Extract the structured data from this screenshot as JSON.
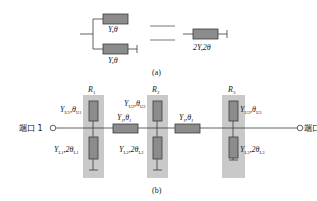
{
  "colors": {
    "component_fill": "#8c8c8c",
    "component_stroke": "#3a3a3a",
    "shade": "#c9c9c9",
    "wire": "#3a3a3a",
    "text": "#222222"
  },
  "part_a": {
    "caption": "(a)",
    "upper_stub_label": "Y,θ",
    "lower_stub_label": "Y,θ",
    "equals": "=",
    "equivalent_label": "2Y,2θ"
  },
  "part_b": {
    "caption": "(b)",
    "port1": "端口 1",
    "port2": "端口 2",
    "resonators": [
      {
        "name": "R",
        "sub": "1",
        "upper": {
          "Y": "Y",
          "Ysub": "U1",
          "t": ",θ",
          "tsub": "U1"
        },
        "lower": {
          "Y": "Y",
          "Ysub": "L1",
          "t": ",2θ",
          "tsub": "L1"
        }
      },
      {
        "name": "R",
        "sub": "2",
        "upper": {
          "Y": "Y",
          "Ysub": "U2",
          "t": ",θ",
          "tsub": "U2"
        },
        "lower": {
          "Y": "Y",
          "Ysub": "L2",
          "t": ",2θ",
          "tsub": "L2"
        }
      },
      {
        "name": "R",
        "sub": "3",
        "upper": {
          "Y": "Y",
          "Ysub": "U3",
          "t": ",θ",
          "tsub": "U3"
        },
        "lower": {
          "Y": "Y",
          "Ysub": "L3",
          "t": ",2θ",
          "tsub": "L3"
        }
      }
    ],
    "series_lines": [
      {
        "Y": "Y",
        "Ysub": "J",
        "t": ",θ",
        "tsub": "J"
      },
      {
        "Y": "Y",
        "Ysub": "J",
        "t": ",θ",
        "tsub": "J"
      }
    ]
  }
}
